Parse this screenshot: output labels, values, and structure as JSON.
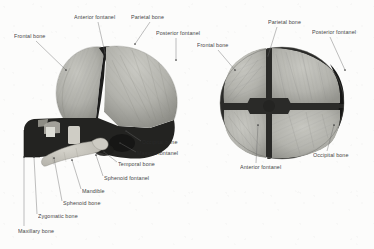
{
  "figure": {
    "background_color": "#fcfcfb",
    "label_color": "#2b2b2b",
    "views": [
      {
        "name": "lateral-view",
        "description": "Lateral (side) view of infant skull"
      },
      {
        "name": "superior-view",
        "description": "Superior (top) view of infant skull"
      }
    ],
    "palette": {
      "bone_light": "#b9b9b4",
      "bone_mid": "#a3a39d",
      "bone_shadow": "#8d8d87",
      "suture_dark": "#2a2a28",
      "fontanel_dark": "#1d1d1c",
      "face_dark": "#232321",
      "mandible_light": "#c9c7bf",
      "leader_line": "#6b6b6b"
    }
  },
  "labels": {
    "lateral": [
      {
        "id": "frontal-bone",
        "text": "Frontal bone",
        "x": 14,
        "y": 33,
        "lx1": 36,
        "ly1": 41,
        "lx2": 66,
        "ly2": 70
      },
      {
        "id": "anterior-fontanel",
        "text": "Anterior fontanel",
        "x": 74,
        "y": 14,
        "lx1": 98,
        "ly1": 22,
        "lx2": 105,
        "ly2": 53
      },
      {
        "id": "parietal-bone",
        "text": "Parietal bone",
        "x": 131,
        "y": 14,
        "lx1": 150,
        "ly1": 22,
        "lx2": 135,
        "ly2": 44
      },
      {
        "id": "posterior-fontanel",
        "text": "Posterior fontanel",
        "x": 156,
        "y": 30,
        "lx1": 176,
        "ly1": 38,
        "lx2": 176,
        "ly2": 60
      },
      {
        "id": "occipital-bone",
        "text": "Occipital bone",
        "x": 142,
        "y": 139,
        "lx1": 141,
        "ly1": 141,
        "lx2": 126,
        "ly2": 131
      },
      {
        "id": "mastoid-fontanel",
        "text": "Mastoid fontanel",
        "x": 137,
        "y": 150,
        "lx1": 136,
        "ly1": 152,
        "lx2": 120,
        "ly2": 143
      },
      {
        "id": "temporal-bone",
        "text": "Temporal bone",
        "x": 118,
        "y": 161,
        "lx1": 117,
        "ly1": 162,
        "lx2": 104,
        "ly2": 152
      },
      {
        "id": "sphenoid-fontanel",
        "text": "Sphenoid fontanel",
        "x": 104,
        "y": 175,
        "lx1": 103,
        "ly1": 176,
        "lx2": 96,
        "ly2": 155
      },
      {
        "id": "mandible",
        "text": "Mandible",
        "x": 82,
        "y": 188,
        "lx1": 81,
        "ly1": 189,
        "lx2": 72,
        "ly2": 160
      },
      {
        "id": "sphenoid-bone",
        "text": "Sphenoid bone",
        "x": 63,
        "y": 200,
        "lx1": 62,
        "ly1": 201,
        "lx2": 54,
        "ly2": 158
      },
      {
        "id": "zygomatic-bone",
        "text": "Zygomatic bone",
        "x": 38,
        "y": 213,
        "lx1": 37,
        "ly1": 214,
        "lx2": 34,
        "ly2": 157
      },
      {
        "id": "maxillary-bone",
        "text": "Maxillary bone",
        "x": 18,
        "y": 228,
        "lx1": 24,
        "ly1": 226,
        "lx2": 24,
        "ly2": 157
      }
    ],
    "superior": [
      {
        "id": "parietal-bone-sup",
        "text": "Parietal bone",
        "x": 268,
        "y": 19,
        "lx1": 277,
        "ly1": 27,
        "lx2": 268,
        "ly2": 56
      },
      {
        "id": "posterior-fontanel-sup",
        "text": "Posterior fontanel",
        "x": 312,
        "y": 29,
        "lx1": 330,
        "ly1": 37,
        "lx2": 345,
        "ly2": 70
      },
      {
        "id": "frontal-bone-sup",
        "text": "Frontal bone",
        "x": 197,
        "y": 42,
        "lx1": 218,
        "ly1": 50,
        "lx2": 235,
        "ly2": 70
      },
      {
        "id": "occipital-bone-sup",
        "text": "Occipital bone",
        "x": 313,
        "y": 152,
        "lx1": 327,
        "ly1": 151,
        "lx2": 334,
        "ly2": 125
      },
      {
        "id": "anterior-fontanel-sup",
        "text": "Anterior fontanel",
        "x": 240,
        "y": 164,
        "lx1": 256,
        "ly1": 163,
        "lx2": 258,
        "ly2": 125
      }
    ]
  }
}
